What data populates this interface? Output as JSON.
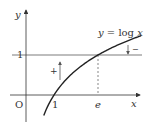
{
  "diagram": {
    "function_label_prefix": "y = log",
    "function_label_var": "x",
    "axes": {
      "x_label": "x",
      "y_label": "y",
      "origin_label": "O"
    },
    "ticks": {
      "x_one": "1",
      "x_e": "e",
      "y_one": "1"
    },
    "signs": {
      "plus": "+",
      "minus": "−"
    },
    "colors": {
      "ink": "#333333",
      "thin": "#555555"
    }
  },
  "chart_data": {
    "type": "line",
    "title": "y = log x",
    "xlabel": "x",
    "ylabel": "y",
    "series": [
      {
        "name": "y = log x",
        "function": "ln(x)",
        "x_range": [
          0.6,
          4.4
        ]
      },
      {
        "name": "y = 1",
        "function": "1"
      }
    ],
    "annotations": [
      {
        "type": "dashed-vertical",
        "x": "e",
        "value": 2.718
      },
      {
        "type": "arrow-up",
        "label": "+",
        "near_x": 0.6
      },
      {
        "type": "arrow-down",
        "label": "−",
        "near_x": 4.3
      }
    ],
    "x_ticks": [
      "1",
      "e"
    ],
    "y_ticks": [
      "1"
    ]
  }
}
